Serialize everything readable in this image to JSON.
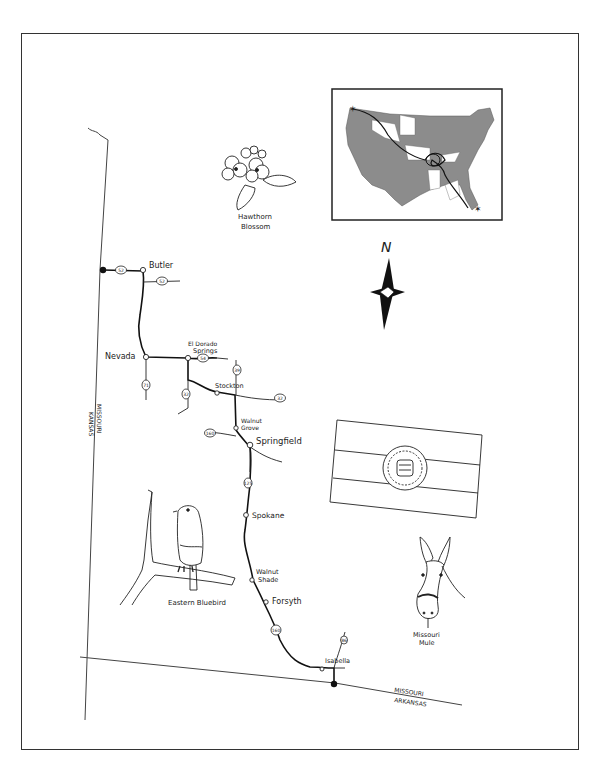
{
  "map": {
    "state": "Missouri",
    "border_labels": {
      "west_left": "KANSAS",
      "west_right": "MISSOURI",
      "south_top": "MISSOURI",
      "south_bottom": "ARKANSAS"
    },
    "north_label": "N",
    "towns": [
      {
        "name": "Butler",
        "label": "Butler"
      },
      {
        "name": "Nevada",
        "label": "Nevada"
      },
      {
        "name": "El Dorado Springs",
        "label_line1": "El Dorado",
        "label_line2": "Springs"
      },
      {
        "name": "Stockton",
        "label": "Stockton"
      },
      {
        "name": "Walnut Grove",
        "label_line1": "Walnut",
        "label_line2": "Grove"
      },
      {
        "name": "Springfield",
        "label": "Springfield"
      },
      {
        "name": "Spokane",
        "label": "Spokane"
      },
      {
        "name": "Walnut Shade",
        "label_line1": "Walnut",
        "label_line2": "Shade"
      },
      {
        "name": "Forsyth",
        "label": "Forsyth"
      },
      {
        "name": "Isabella",
        "label": "Isabella"
      }
    ],
    "route_shields": [
      "52",
      "52",
      "54",
      "71",
      "32",
      "39",
      "32",
      "160",
      "125",
      "160",
      "86"
    ],
    "illustrations": {
      "flower": {
        "line1": "Hawthorn",
        "line2": "Blossom"
      },
      "bird": {
        "label": "Eastern Bluebird"
      },
      "animal": {
        "line1": "Missouri",
        "line2": "Mule"
      },
      "flag": "Missouri state flag",
      "inset": "United States route overview"
    },
    "colors": {
      "ink": "#222222",
      "inset_fill": "#8c8c8c",
      "paper": "#ffffff"
    }
  }
}
